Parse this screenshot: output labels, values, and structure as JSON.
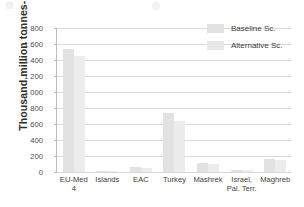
{
  "chart_data": {
    "type": "bar",
    "title": "",
    "subtitle": "",
    "xlabel": "",
    "ylabel": "Thousand million tonnes-km",
    "ylim": [
      0,
      1800
    ],
    "ytick_values": [
      0,
      200,
      400,
      600,
      800,
      1000,
      1200,
      1400,
      1600,
      1800
    ],
    "ytick_labels": [
      "0",
      "200",
      "400",
      "600",
      "800",
      "1 000",
      "1 200",
      "1 400",
      "1 600",
      "1 800"
    ],
    "grid": true,
    "legend_position": "top-right",
    "categories": [
      "EU-Med 4",
      "Islands",
      "EAC",
      "Turkey",
      "Mashrek",
      "Israel,\nPal. Terr.",
      "Maghreb"
    ],
    "series": [
      {
        "name": "Baseline Sc.",
        "color": "#e2e2e2",
        "values": [
          1540,
          15,
          60,
          740,
          110,
          25,
          165
        ]
      },
      {
        "name": "Alternative Sc.",
        "color": "#ececec",
        "values": [
          1450,
          12,
          55,
          640,
          100,
          20,
          150
        ]
      }
    ]
  },
  "legend": {
    "items": [
      {
        "label": "Baseline Sc."
      },
      {
        "label": "Alternative Sc."
      }
    ]
  }
}
